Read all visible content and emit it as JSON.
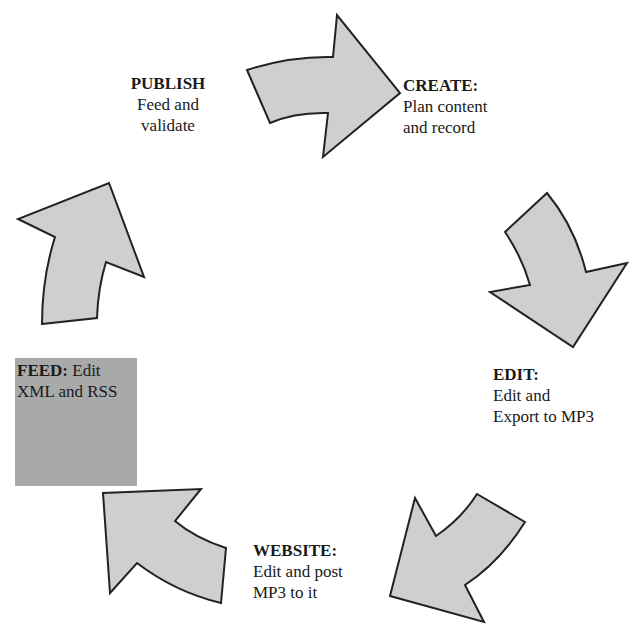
{
  "diagram": {
    "type": "cycle",
    "arrow_fill": "#cfcfcf",
    "arrow_stroke": "#222222",
    "feed_box_fill": "#a9a9a9",
    "steps": [
      {
        "id": "create",
        "title": "CREATE:",
        "line1": "Plan content",
        "line2": "and record"
      },
      {
        "id": "edit",
        "title": "EDIT:",
        "line1": "Edit and",
        "line2": "Export to MP3"
      },
      {
        "id": "website",
        "title": "WEBSITE:",
        "line1": "Edit and post",
        "line2": "MP3 to it"
      },
      {
        "id": "feed",
        "title": "FEED:",
        "inline": " Edit",
        "line2": "XML and RSS"
      },
      {
        "id": "publish",
        "title": "PUBLISH",
        "line1": "Feed and",
        "line2": "validate"
      }
    ]
  }
}
